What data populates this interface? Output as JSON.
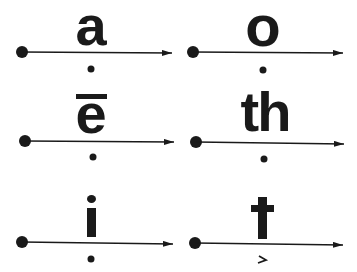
{
  "diagram": {
    "title": "",
    "colors": {
      "ink": "#1a1a1a",
      "background": "#ffffff"
    },
    "cells": [
      {
        "id": "a",
        "symbol": "a",
        "macron": false,
        "below_mark": "dot",
        "row": 0,
        "col": 0
      },
      {
        "id": "o",
        "symbol": "o",
        "macron": false,
        "below_mark": "dot",
        "row": 0,
        "col": 1
      },
      {
        "id": "e",
        "symbol": "e",
        "macron": true,
        "below_mark": "dot",
        "row": 1,
        "col": 0
      },
      {
        "id": "th",
        "symbol": "th",
        "macron": false,
        "below_mark": "dot",
        "row": 1,
        "col": 1
      },
      {
        "id": "i",
        "symbol": "i",
        "macron": false,
        "below_mark": "dot",
        "row": 2,
        "col": 0
      },
      {
        "id": "t",
        "symbol": "t",
        "macron": false,
        "below_mark": "hook",
        "row": 2,
        "col": 1
      }
    ]
  }
}
